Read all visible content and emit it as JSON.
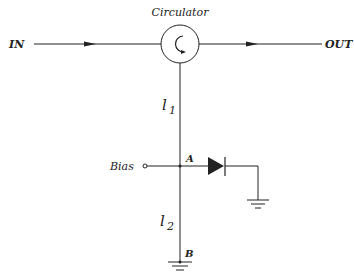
{
  "diagram": {
    "title_label": "Circulator",
    "port_in": "IN",
    "port_out": "OUT",
    "line_upper": "l",
    "line_upper_sub": "1",
    "line_lower": "l",
    "line_lower_sub": "2",
    "bias_label": "Bias",
    "node_a": "A",
    "node_b": "B",
    "colors": {
      "stroke": "#222222",
      "background": "#ffffff"
    }
  }
}
